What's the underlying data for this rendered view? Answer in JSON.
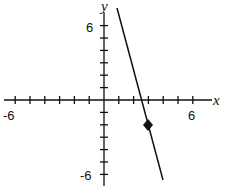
{
  "chart_data": {
    "type": "line",
    "title": "",
    "xlabel": "x",
    "ylabel": "y",
    "xlim": [
      -6,
      6
    ],
    "ylim": [
      -6,
      6
    ],
    "x_tick_labels": [
      "-6",
      "6"
    ],
    "y_tick_labels": [
      "6",
      "-6"
    ],
    "tick_step": 1,
    "grid": false,
    "series": [
      {
        "name": "line",
        "x": [
          0.9,
          4.0
        ],
        "y": [
          7.4,
          -6.4
        ],
        "slope_approx": -4.5
      }
    ],
    "points": [
      {
        "x": 3,
        "y": -2,
        "marker": "diamond"
      }
    ]
  },
  "labels": {
    "x_axis": "x",
    "y_axis": "y",
    "x_min": "-6",
    "x_max": "6",
    "y_max": "6",
    "y_min": "-6"
  }
}
